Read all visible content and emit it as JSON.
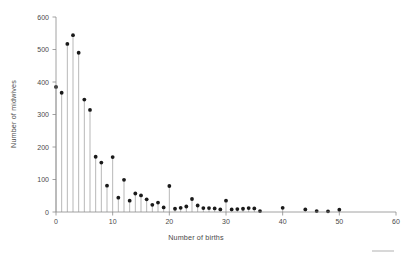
{
  "chart_data": {
    "type": "scatter",
    "title": "",
    "subtitle": "",
    "xlabel": "Number of births",
    "ylabel": "Number of midwives",
    "xlim": [
      0,
      60
    ],
    "ylim": [
      0,
      600
    ],
    "xticks": [
      0,
      10,
      20,
      30,
      40,
      50,
      60
    ],
    "xtick_labels": [
      "0",
      "10",
      "20",
      "30",
      "40",
      "50",
      "60"
    ],
    "yticks": [
      0,
      100,
      200,
      300,
      400,
      500,
      600
    ],
    "ytick_labels": [
      "0",
      "100",
      "200",
      "300",
      "400",
      "500",
      "600"
    ],
    "grid": false,
    "legend": "none",
    "marker": "filled-circle",
    "stems": true,
    "x": [
      0,
      1,
      2,
      3,
      4,
      5,
      6,
      7,
      8,
      9,
      10,
      11,
      12,
      13,
      14,
      15,
      16,
      17,
      18,
      19,
      20,
      21,
      22,
      23,
      24,
      25,
      26,
      27,
      28,
      29,
      30,
      31,
      32,
      33,
      34,
      35,
      36,
      40,
      44,
      46,
      48,
      50
    ],
    "values": [
      385,
      367,
      517,
      544,
      490,
      346,
      314,
      170,
      152,
      81,
      169,
      44,
      99,
      35,
      57,
      51,
      39,
      22,
      29,
      14,
      80,
      10,
      13,
      17,
      40,
      20,
      12,
      12,
      11,
      8,
      35,
      8,
      9,
      10,
      12,
      11,
      3,
      13,
      8,
      3,
      2,
      7
    ]
  },
  "axis": {
    "y_label": "Number of midwives",
    "x_label": "Number of births"
  },
  "colors": {
    "marker": "#1a1a1a",
    "stem": "#9a9a9a",
    "axis": "#8a8a8a",
    "text": "#4a4a4a",
    "background": "#ffffff"
  }
}
